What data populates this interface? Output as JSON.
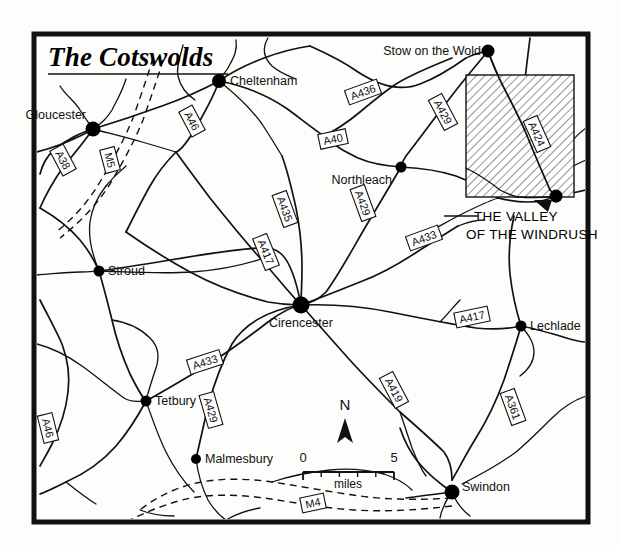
{
  "map": {
    "title": "The Cotswolds",
    "inset_caption_line1": "THE VALLEY",
    "inset_caption_line2": "OF THE WINDRUSH",
    "north_label": "N",
    "frame_color": "#111111",
    "background_color": "#fdfdfb",
    "hatch_color": "#444444"
  },
  "scale_bar": {
    "min_label": "0",
    "max_label": "5",
    "unit_label": "miles",
    "min_value": 0,
    "max_value": 5,
    "divisions": 5
  },
  "towns": [
    {
      "name": "Gloucester",
      "x": 93,
      "y": 129,
      "label_x": 86,
      "label_y": 119,
      "anchor": "end",
      "dot_r": 7.5
    },
    {
      "name": "Cheltenham",
      "x": 219,
      "y": 81,
      "label_x": 230,
      "label_y": 85,
      "anchor": "start",
      "dot_r": 7.0
    },
    {
      "name": "Stow on the Wold",
      "x": 488,
      "y": 51,
      "label_x": 481,
      "label_y": 55,
      "anchor": "end",
      "dot_r": 6.5
    },
    {
      "name": "Northleach",
      "x": 401,
      "y": 167,
      "label_x": 392,
      "label_y": 184,
      "anchor": "end",
      "dot_r": 5.5
    },
    {
      "name": "Stroud",
      "x": 99,
      "y": 271,
      "label_x": 108,
      "label_y": 275,
      "anchor": "start",
      "dot_r": 5.5
    },
    {
      "name": "Cirencester",
      "x": 301,
      "y": 305,
      "label_x": 301,
      "label_y": 327,
      "anchor": "middle",
      "dot_r": 8.5
    },
    {
      "name": "Lechlade",
      "x": 521,
      "y": 326,
      "label_x": 530,
      "label_y": 330,
      "anchor": "start",
      "dot_r": 5.5
    },
    {
      "name": "Tetbury",
      "x": 146,
      "y": 401,
      "label_x": 155,
      "label_y": 405,
      "anchor": "start",
      "dot_r": 5.5
    },
    {
      "name": "Malmesbury",
      "x": 196,
      "y": 459,
      "label_x": 205,
      "label_y": 463,
      "anchor": "start",
      "dot_r": 5.0
    },
    {
      "name": "Swindon",
      "x": 452,
      "y": 492,
      "label_x": 462,
      "label_y": 491,
      "anchor": "start",
      "dot_r": 7.5
    }
  ],
  "road_shields": [
    {
      "number": "A38",
      "x": 63,
      "y": 160,
      "rot": 62
    },
    {
      "number": "M5",
      "x": 110,
      "y": 160,
      "rot": 75
    },
    {
      "number": "A46",
      "x": 192,
      "y": 121,
      "rot": 62
    },
    {
      "number": "A436",
      "x": 363,
      "y": 92,
      "rot": -20
    },
    {
      "number": "A40",
      "x": 333,
      "y": 139,
      "rot": -12
    },
    {
      "number": "A429",
      "x": 443,
      "y": 112,
      "rot": 62
    },
    {
      "number": "A424",
      "x": 537,
      "y": 134,
      "rot": 66
    },
    {
      "number": "A435",
      "x": 285,
      "y": 209,
      "rot": 70
    },
    {
      "number": "A429",
      "x": 363,
      "y": 203,
      "rot": 70
    },
    {
      "number": "A433",
      "x": 424,
      "y": 238,
      "rot": -20
    },
    {
      "number": "A417",
      "x": 266,
      "y": 252,
      "rot": 68
    },
    {
      "number": "A417",
      "x": 472,
      "y": 317,
      "rot": -12
    },
    {
      "number": "A433",
      "x": 205,
      "y": 362,
      "rot": -18
    },
    {
      "number": "A429",
      "x": 211,
      "y": 410,
      "rot": 74
    },
    {
      "number": "A419",
      "x": 394,
      "y": 390,
      "rot": 62
    },
    {
      "number": "A361",
      "x": 513,
      "y": 407,
      "rot": 70
    },
    {
      "number": "A46",
      "x": 48,
      "y": 428,
      "rot": 76
    },
    {
      "number": "M4",
      "x": 313,
      "y": 503,
      "rot": -12
    }
  ],
  "inset_box": {
    "x": 466,
    "y": 75,
    "width": 108,
    "height": 122
  },
  "frame": {
    "x": 34,
    "y": 34,
    "width": 554,
    "height": 488,
    "stroke_width": 5
  }
}
